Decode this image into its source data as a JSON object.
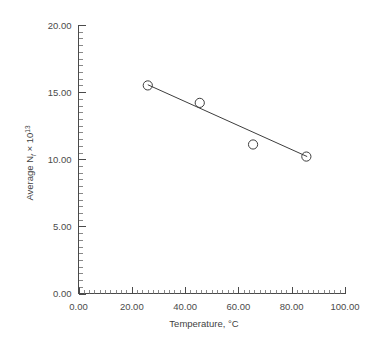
{
  "chart_data": {
    "type": "scatter",
    "title": "",
    "xlabel": "Temperature, °C",
    "ylabel": "Average N_f × 10^13",
    "ylabel_parts": {
      "prefix": "Average N",
      "subscript": "f",
      "multiplier": " × 10",
      "exponent": "13"
    },
    "xlim": [
      0,
      100
    ],
    "ylim": [
      0,
      20
    ],
    "xticks": [
      0,
      20,
      40,
      60,
      80,
      100
    ],
    "yticks": [
      0,
      5,
      10,
      15,
      20
    ],
    "xtick_labels": [
      "0.00",
      "20.00",
      "40.00",
      "60.00",
      "80.00",
      "100.00"
    ],
    "ytick_labels": [
      "0.00",
      "5.00",
      "10.00",
      "15.00",
      "20.00"
    ],
    "x_minor_step": 2,
    "y_minor_step": 0.5,
    "grid": false,
    "legend": false,
    "marker_style": "open-circle",
    "x": [
      26,
      45.5,
      65.5,
      85.5
    ],
    "y": [
      15.5,
      14.2,
      11.1,
      10.2
    ],
    "points": [
      {
        "x": 26.0,
        "y": 15.5
      },
      {
        "x": 45.5,
        "y": 14.2
      },
      {
        "x": 65.5,
        "y": 11.1
      },
      {
        "x": 85.5,
        "y": 10.2
      }
    ],
    "series": [
      {
        "name": "Average N_f",
        "values": [
          15.5,
          14.2,
          11.1,
          10.2
        ]
      }
    ],
    "trendline": {
      "type": "line",
      "x_start": 26.0,
      "y_start": 15.55,
      "x_end": 85.8,
      "y_end": 10.2
    },
    "colors": {
      "axis": "#4a4a4a",
      "line": "#3d3d3d",
      "marker_stroke": "#3d3d3d",
      "text": "#4b4b4b",
      "background": "#ffffff"
    }
  }
}
